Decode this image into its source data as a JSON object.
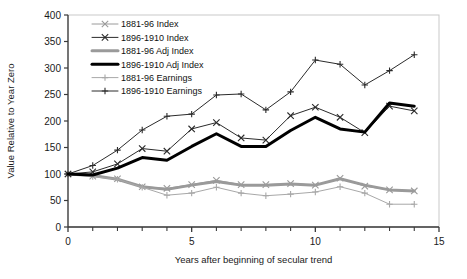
{
  "chart_data": {
    "type": "line",
    "title": "",
    "xlabel": "Years after beginning of secular trend",
    "ylabel": "Value Relative to Year Zero",
    "xlim": [
      0,
      15
    ],
    "ylim": [
      0,
      400
    ],
    "xticks": [
      0,
      5,
      10,
      15
    ],
    "xtick_labels": [
      "0",
      "5",
      "10",
      "15"
    ],
    "xminor_ticks": [
      1,
      2,
      3,
      4,
      6,
      7,
      8,
      9,
      11,
      12,
      13,
      14
    ],
    "yticks": [
      0,
      50,
      100,
      150,
      200,
      250,
      300,
      350,
      400
    ],
    "ytick_labels": [
      "0",
      "50",
      "100",
      "150",
      "200",
      "250",
      "300",
      "350",
      "400"
    ],
    "grid": false,
    "legend_position": "upper left",
    "x": [
      0,
      1,
      2,
      3,
      4,
      5,
      6,
      7,
      8,
      9,
      10,
      11,
      12,
      13,
      14
    ],
    "series": [
      {
        "name": "1881-96 Index",
        "color": "#9a9a9a",
        "marker": "x",
        "width": 1,
        "values": [
          100,
          96,
          91,
          76,
          73,
          80,
          88,
          80,
          80,
          82,
          79,
          92,
          77,
          70,
          68
        ]
      },
      {
        "name": "1896-1910 Index",
        "color": "#2b2b2b",
        "marker": "x",
        "width": 1,
        "values": [
          100,
          104,
          119,
          148,
          143,
          185,
          197,
          168,
          164,
          210,
          226,
          207,
          178,
          228,
          219
        ]
      },
      {
        "name": "1881-96 Adj Index",
        "color": "#9a9a9a",
        "marker": "none",
        "width": 3,
        "values": [
          100,
          97,
          90,
          76,
          71,
          79,
          86,
          79,
          79,
          81,
          79,
          91,
          79,
          70,
          68
        ]
      },
      {
        "name": "1896-1910 Adj Index",
        "color": "#000000",
        "marker": "none",
        "width": 3,
        "values": [
          100,
          98,
          111,
          131,
          126,
          152,
          176,
          152,
          152,
          182,
          207,
          185,
          179,
          234,
          228
        ]
      },
      {
        "name": "1881-96 Earnings",
        "color": "#a8a8a8",
        "marker": "plus",
        "width": 1,
        "values": [
          100,
          95,
          90,
          75,
          60,
          64,
          75,
          64,
          59,
          62,
          66,
          76,
          64,
          43,
          43
        ]
      },
      {
        "name": "1896-1910 Earnings",
        "color": "#2b2b2b",
        "marker": "plus",
        "width": 1,
        "values": [
          100,
          116,
          145,
          183,
          209,
          213,
          249,
          251,
          221,
          255,
          315,
          307,
          268,
          295,
          325
        ]
      }
    ]
  }
}
